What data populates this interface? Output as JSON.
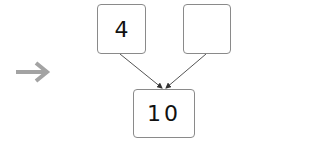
{
  "diagram": {
    "type": "number-bond",
    "parts": [
      {
        "label": "part-left",
        "value": "4"
      },
      {
        "label": "part-right",
        "value": ""
      }
    ],
    "whole": {
      "value": "10"
    },
    "pointer": {
      "icon": "right-arrow-icon",
      "color": "#a0a0a0"
    },
    "colors": {
      "box_border": "#8a8a8a",
      "connector": "#555555",
      "text": "#111111"
    }
  }
}
